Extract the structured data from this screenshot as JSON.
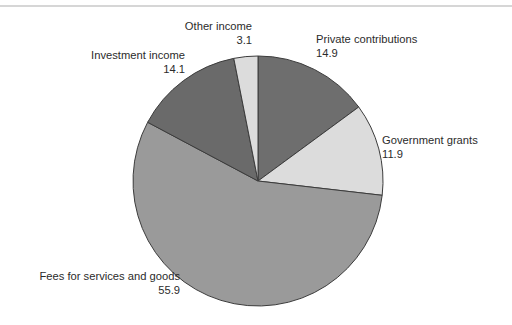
{
  "chart_data": {
    "type": "pie",
    "title": "",
    "subtitle": "",
    "xlabel": "",
    "ylabel": "",
    "legend_position": "none",
    "grid": false,
    "start_angle_deg": 0,
    "direction": "clockwise",
    "total": 99.9,
    "categories": [
      "Private contributions",
      "Government grants",
      "Fees for services and goods",
      "Investment income",
      "Other income"
    ],
    "values": [
      14.9,
      11.9,
      55.9,
      14.1,
      3.1
    ],
    "value_labels": [
      "14.9",
      "11.9",
      "55.9",
      "14.1",
      "3.1"
    ],
    "colors": [
      "#6e6e6e",
      "#dcdcdc",
      "#9a9a9a",
      "#6a6a6a",
      "#dcdcdc"
    ],
    "slices": [
      {
        "name": "Private contributions",
        "value": 14.9,
        "value_label": "14.9",
        "color": "#6e6e6e"
      },
      {
        "name": "Government grants",
        "value": 11.9,
        "value_label": "11.9",
        "color": "#dcdcdc"
      },
      {
        "name": "Fees for services and goods",
        "value": 55.9,
        "value_label": "55.9",
        "color": "#9a9a9a"
      },
      {
        "name": "Investment income",
        "value": 14.1,
        "value_label": "14.1",
        "color": "#6a6a6a"
      },
      {
        "name": "Other income",
        "value": 3.1,
        "value_label": "3.1",
        "color": "#dcdcdc"
      }
    ]
  },
  "labels": {
    "other_income": {
      "name": "Other income",
      "value": "3.1"
    },
    "private_contributions": {
      "name": "Private contributions",
      "value": "14.9"
    },
    "investment_income": {
      "name": "Investment income",
      "value": "14.1"
    },
    "government_grants": {
      "name": "Government grants",
      "value": "11.9"
    },
    "fees_services_goods": {
      "name": "Fees for services and goods",
      "value": "55.9"
    }
  },
  "style": {
    "slice_outline": "#3c3c3c",
    "background": "#ffffff",
    "rule_color": "#d6d6d6",
    "text_color": "#2b2b2b"
  }
}
